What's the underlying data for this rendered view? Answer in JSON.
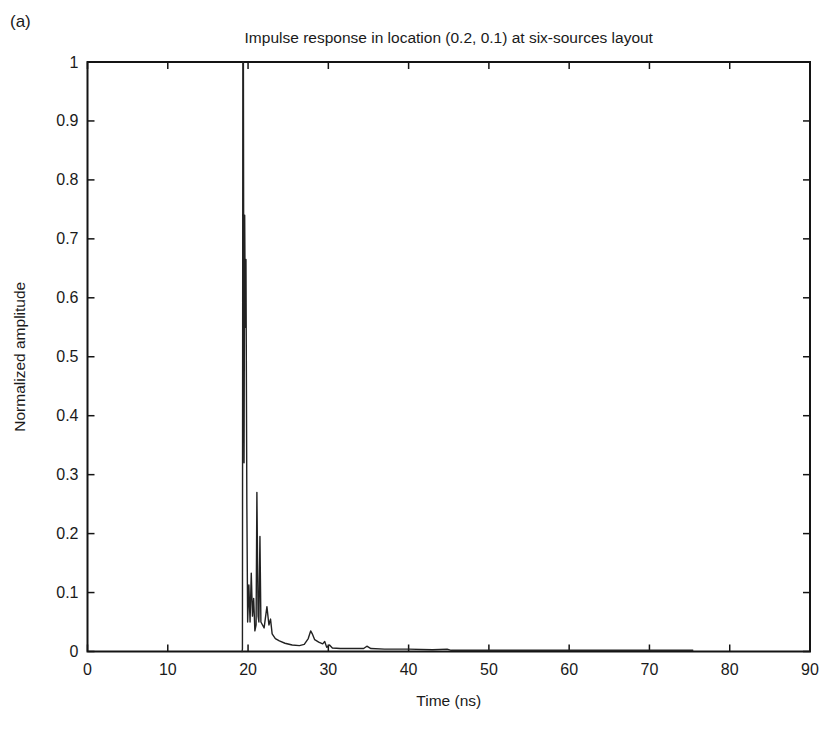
{
  "figure_label": "(a)",
  "chart_data": {
    "type": "line",
    "title": "Impulse response in location (0.2, 0.1) at six-sources layout",
    "xlabel": "Time (ns)",
    "ylabel": "Normalized amplitude",
    "xlim": [
      0,
      90
    ],
    "ylim": [
      0,
      1
    ],
    "x_ticks": [
      0,
      10,
      20,
      30,
      40,
      50,
      60,
      70,
      80,
      90
    ],
    "y_ticks": [
      0,
      0.1,
      0.2,
      0.3,
      0.4,
      0.5,
      0.6,
      0.7,
      0.8,
      0.9,
      1
    ],
    "grid": false,
    "legend": null,
    "box": true,
    "axis_color": "#141414",
    "line_color": "#222222",
    "background_color": "#ffffff",
    "series": [
      {
        "name": "impulse-response",
        "points": [
          [
            19.25,
            0
          ],
          [
            19.3,
            0.004
          ],
          [
            19.35,
            1.0
          ],
          [
            19.42,
            1.0
          ],
          [
            19.5,
            0.32
          ],
          [
            19.58,
            0.74
          ],
          [
            19.66,
            0.55
          ],
          [
            19.74,
            0.665
          ],
          [
            19.85,
            0.25
          ],
          [
            19.95,
            0.05
          ],
          [
            20.1,
            0.113
          ],
          [
            20.25,
            0.05
          ],
          [
            20.4,
            0.133
          ],
          [
            20.55,
            0.06
          ],
          [
            20.7,
            0.09
          ],
          [
            20.85,
            0.035
          ],
          [
            21.0,
            0.045
          ],
          [
            21.1,
            0.27
          ],
          [
            21.25,
            0.06
          ],
          [
            21.35,
            0.05
          ],
          [
            21.48,
            0.195
          ],
          [
            21.6,
            0.05
          ],
          [
            22.0,
            0.04
          ],
          [
            22.35,
            0.076
          ],
          [
            22.6,
            0.045
          ],
          [
            22.8,
            0.055
          ],
          [
            23.0,
            0.03
          ],
          [
            23.4,
            0.022
          ],
          [
            23.9,
            0.018
          ],
          [
            24.6,
            0.014
          ],
          [
            25.5,
            0.011
          ],
          [
            26.4,
            0.01
          ],
          [
            27.0,
            0.012
          ],
          [
            27.5,
            0.022
          ],
          [
            27.8,
            0.035
          ],
          [
            28.0,
            0.03
          ],
          [
            28.3,
            0.02
          ],
          [
            28.8,
            0.016
          ],
          [
            29.3,
            0.013
          ],
          [
            29.55,
            0.017
          ],
          [
            29.8,
            0.007
          ],
          [
            30.15,
            0.011
          ],
          [
            30.5,
            0.006
          ],
          [
            31.5,
            0.005
          ],
          [
            33.0,
            0.005
          ],
          [
            34.4,
            0.005
          ],
          [
            34.8,
            0.009
          ],
          [
            35.3,
            0.005
          ],
          [
            37.0,
            0.004
          ],
          [
            40.0,
            0.004
          ],
          [
            43.0,
            0.003
          ],
          [
            44.8,
            0.004
          ],
          [
            45.3,
            0.002
          ],
          [
            50.0,
            0.002
          ],
          [
            55.0,
            0.002
          ],
          [
            60.0,
            0.002
          ],
          [
            65.0,
            0.002
          ],
          [
            70.0,
            0.002
          ],
          [
            75.4,
            0.002
          ]
        ]
      }
    ]
  }
}
